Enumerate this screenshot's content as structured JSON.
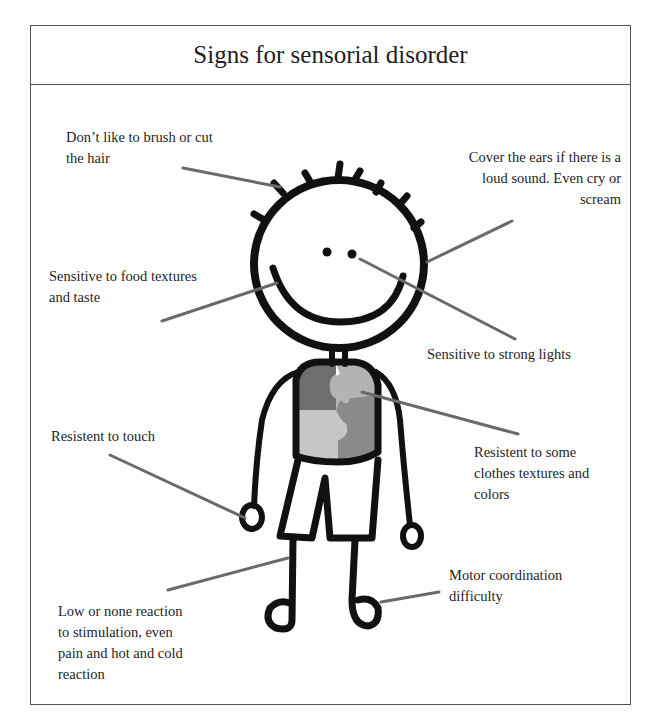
{
  "title": "Signs for sensorial disorder",
  "colors": {
    "border": "#555555",
    "outline": "#111111",
    "leader_line": "#6a6a6a",
    "puzzle_dark": "#6e6e6e",
    "puzzle_light_top": "#b3b3b3",
    "puzzle_light_bottom": "#c6c6c6",
    "puzzle_mid": "#8a8a8a"
  },
  "labels": [
    {
      "id": "hair",
      "lines": [
        "Don’t like to brush or cut",
        "the hair"
      ]
    },
    {
      "id": "ears",
      "lines": [
        "Cover the ears if there is a",
        "loud sound. Even cry or",
        "scream"
      ]
    },
    {
      "id": "food",
      "lines": [
        "Sensitive to food textures",
        "and taste"
      ]
    },
    {
      "id": "lights",
      "lines": [
        "Sensitive to  strong lights"
      ]
    },
    {
      "id": "touch",
      "lines": [
        "Resistent to touch"
      ]
    },
    {
      "id": "clothes",
      "lines": [
        "Resistent to some",
        "clothes textures and",
        "colors"
      ]
    },
    {
      "id": "stimulation",
      "lines": [
        "Low or none reaction",
        "to stimulation, even",
        "pain and hot and cold",
        "reaction"
      ]
    },
    {
      "id": "motor",
      "lines": [
        "Motor coordination",
        "difficulty"
      ]
    }
  ],
  "figure": {
    "icon": "child-figure-icon"
  }
}
